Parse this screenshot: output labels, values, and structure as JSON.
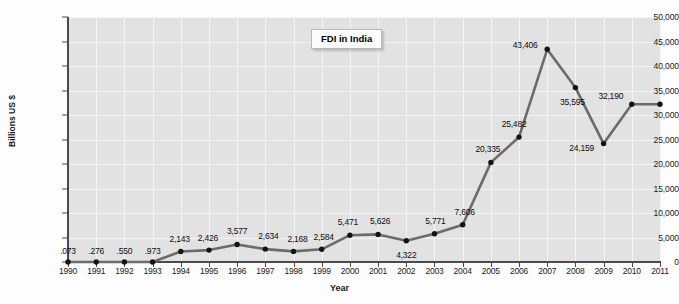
{
  "chart_data": {
    "type": "line",
    "title": "FDI in India",
    "xlabel": "Year",
    "ylabel": "Billions US $",
    "grid": true,
    "legend": "none",
    "categories": [
      "1990",
      "1991",
      "1992",
      "1993",
      "1994",
      "1995",
      "1996",
      "1997",
      "1998",
      "1999",
      "2000",
      "2001",
      "2002",
      "2003",
      "2004",
      "2005",
      "2006",
      "2007",
      "2008",
      "2009",
      "2010",
      "2011"
    ],
    "values": [
      0.073,
      0.276,
      0.55,
      0.973,
      2143,
      2426,
      3577,
      2634,
      2168,
      2584,
      5471,
      5626,
      4322,
      5771,
      7606,
      20335,
      25482,
      43406,
      35595,
      24159,
      32190,
      32190
    ],
    "point_labels": [
      ".073",
      ".276",
      ".550",
      ".973",
      "2,143",
      "2,426",
      "3,577",
      "2,634",
      "2,168",
      "2,584",
      "5,471",
      "5,626",
      "4,322",
      "5,771",
      "7,606",
      "20,335",
      "25,482",
      "43,406",
      "35,595",
      "24,159",
      "32,190",
      ""
    ],
    "ylim": [
      0,
      50000
    ],
    "yticks": [
      0,
      5000,
      10000,
      15000,
      20000,
      25000,
      30000,
      35000,
      40000,
      45000,
      50000
    ],
    "ytick_labels": [
      "0",
      "5,000",
      "10,000",
      "15,000",
      "20,000",
      "25,000",
      "30,000",
      "35,000",
      "40,000",
      "45,000",
      "50,000"
    ],
    "series_color": "#6b6b6b",
    "marker_color": "#141414",
    "plot_bg": "#e2e2e2",
    "grid_color": "#f4f4f4"
  }
}
